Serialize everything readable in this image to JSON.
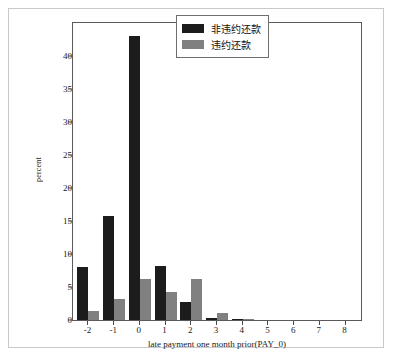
{
  "chart_data": {
    "type": "bar",
    "title": "",
    "xlabel": "late payment one month prior(PAY_0)",
    "ylabel": "percent",
    "categories": [
      "-2",
      "-1",
      "0",
      "1",
      "2",
      "3",
      "4",
      "5",
      "6",
      "7",
      "8"
    ],
    "series": [
      {
        "name": "非违约还款",
        "color": "#1c1c1c",
        "values": [
          8.0,
          15.8,
          43.0,
          8.2,
          2.7,
          0.3,
          0.15,
          0.0,
          0.0,
          0.0,
          0.0
        ]
      },
      {
        "name": "违约还款",
        "color": "#808080",
        "values": [
          1.3,
          3.2,
          6.2,
          4.2,
          6.2,
          1.0,
          0.15,
          0.0,
          0.0,
          0.0,
          0.0
        ]
      }
    ],
    "ylim": [
      0,
      45
    ],
    "yticks": [
      0,
      5,
      10,
      15,
      20,
      25,
      30,
      35,
      40
    ],
    "xlim": [
      -2.6,
      8.6
    ],
    "grid": false,
    "legend_position": "top-right"
  },
  "legend": {
    "entries": [
      {
        "label": "非违约还款"
      },
      {
        "label": "违约还款"
      }
    ]
  }
}
